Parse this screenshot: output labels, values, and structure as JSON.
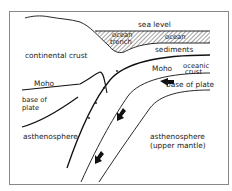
{
  "diagram": {
    "type": "subduction-zone cross-section",
    "labels": {
      "sea_level": "sea level",
      "ocean_trench_1": "ocean",
      "ocean_trench_2": "trench",
      "ocean": "ocean",
      "sediments": "sediments",
      "continental_crust": "continental crust",
      "moho_left": "Moho",
      "moho_right": "Moho",
      "oceanic_crust_1": "oceanic",
      "oceanic_crust_2": "crust",
      "base_of_plate_right": "base of plate",
      "base_of_plate_left_1": "base of",
      "base_of_plate_left_2": "plate",
      "asthenosphere_left": "asthenosphere",
      "asthenosphere_right_1": "asthenosphere",
      "asthenosphere_right_2": "(upper mantle)"
    },
    "arrows": [
      {
        "name": "plate-motion-arrow-horizontal",
        "direction": "left"
      },
      {
        "name": "plate-motion-arrow-upper",
        "direction": "down-left"
      },
      {
        "name": "plate-motion-arrow-lower",
        "direction": "down-left"
      }
    ],
    "colors": {
      "line": "#111111",
      "frame": "#888888",
      "text": "#222222",
      "background": "#ffffff"
    }
  }
}
